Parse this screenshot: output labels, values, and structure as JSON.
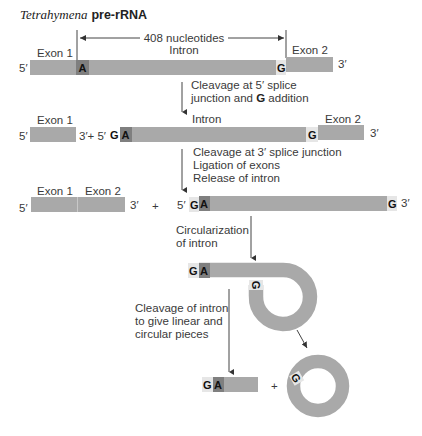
{
  "title": {
    "organism": "Tetrahymena",
    "molecule": "pre-rRNA"
  },
  "colors": {
    "rna_bar": "#a9a9a9",
    "a_nucleotide": "#7f7f7f",
    "g_nucleotide": "#e6e6e6",
    "arrow": "#444444",
    "text": "#3a3a3a"
  },
  "labels": {
    "five_prime": "5′",
    "three_prime": "3′",
    "three_plus_five": "3′+ 5′",
    "plus": "+",
    "A": "A",
    "G": "G",
    "exon1": "Exon 1",
    "exon2": "Exon 2",
    "intron": "Intron",
    "length": "408 nucleotides"
  },
  "steps": [
    {
      "line1": "Cleavage at 5′ splice",
      "line2_pre": "junction and ",
      "line2_bold": "G",
      "line2_post": " addition"
    },
    {
      "line1": "Cleavage at 3′ splice junction",
      "line2": "Ligation of exons",
      "line3": "Release of intron"
    },
    {
      "line1": "Circularization",
      "line2": "of intron"
    },
    {
      "line1": "Cleavage of intron",
      "line2": "to give linear and",
      "line3": "circular pieces"
    }
  ]
}
